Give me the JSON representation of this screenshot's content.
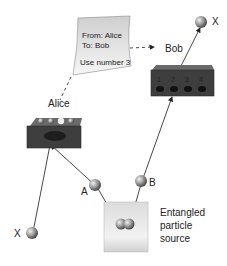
{
  "note": {
    "from_line": "From: Alice",
    "to_line": "To: Bob",
    "body_line": "Use number 3"
  },
  "labels": {
    "alice": "Alice",
    "bob": "Bob",
    "particle_a": "A",
    "particle_b": "B",
    "x_left": "X",
    "x_right": "X",
    "source_line1": "Entangled",
    "source_line2": "particle",
    "source_line3": "source"
  },
  "bob_box": {
    "ports": [
      "1",
      "2",
      "3",
      "4"
    ]
  },
  "colors": {
    "box_dark": "#3a3a3a",
    "box_top": "#6a6a6a",
    "sphere": "#9a9a9a",
    "note_fill": "#e4e4e4",
    "source_box": "#e8e8e8"
  }
}
